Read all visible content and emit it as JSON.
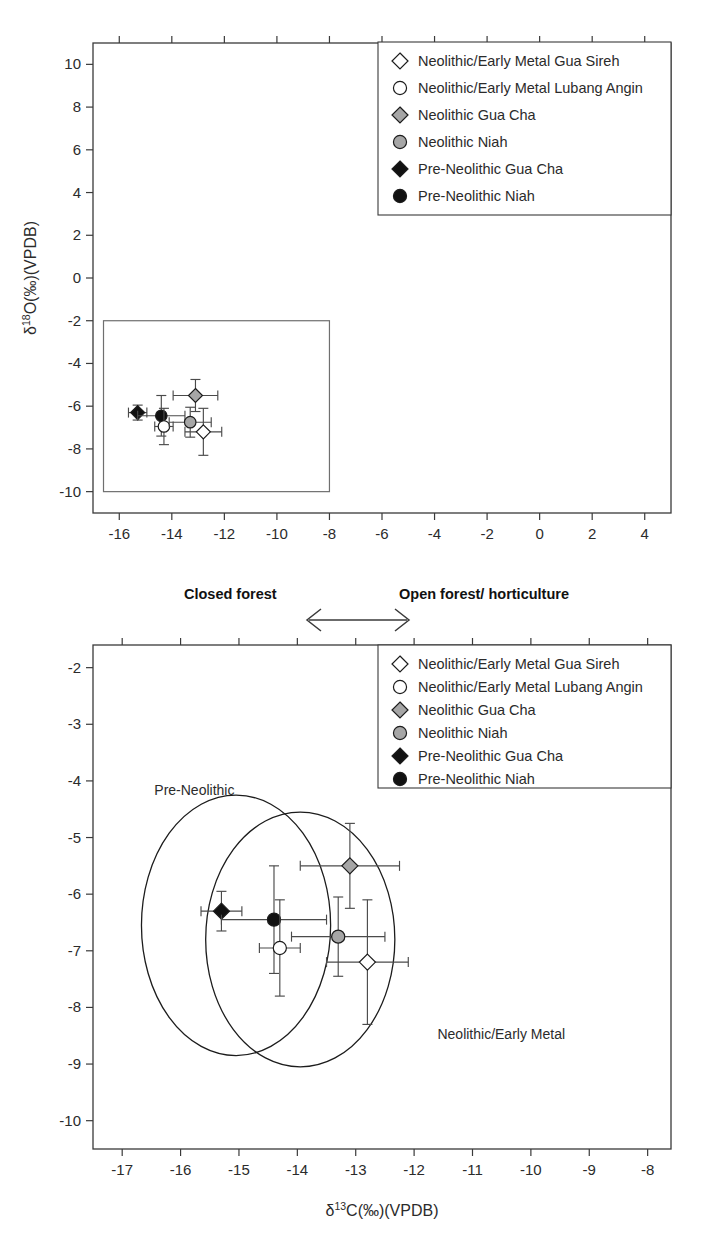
{
  "figure": {
    "background": "#ffffff",
    "ink": "#231f20"
  },
  "legend": {
    "entries": [
      {
        "label": "Neolithic/Early Metal Gua Sireh",
        "marker": "diamond",
        "fill": "#ffffff",
        "key": "nem_gua_sireh"
      },
      {
        "label": "Neolithic/Early Metal Lubang Angin",
        "marker": "circle",
        "fill": "#ffffff",
        "key": "nem_lubang_angin"
      },
      {
        "label": "Neolithic Gua Cha",
        "marker": "diamond",
        "fill": "#a6a6a6",
        "key": "neo_gua_cha"
      },
      {
        "label": "Neolithic Niah",
        "marker": "circle",
        "fill": "#a6a6a6",
        "key": "neo_niah"
      },
      {
        "label": "Pre-Neolithic Gua Cha",
        "marker": "diamond",
        "fill": "#111111",
        "key": "pre_gua_cha"
      },
      {
        "label": "Pre-Neolithic Niah",
        "marker": "circle",
        "fill": "#111111",
        "key": "pre_niah"
      }
    ]
  },
  "middle_annotation": {
    "left_label": "Closed forest",
    "right_label": "Open forest/ horticulture",
    "arrow": "double-headed-horizontal-arrow"
  },
  "axis_titles": {
    "d18O": {
      "delta": "δ",
      "sup": "18",
      "rest": "O(‰)(VPDB)"
    },
    "d13C": {
      "delta": "δ",
      "sup": "13",
      "rest": "C(‰)(VPDB)"
    }
  },
  "chart_data": [
    {
      "id": "top-panel",
      "type": "scatter",
      "title": "",
      "xlabel": "δ13C(‰)(VPDB)",
      "ylabel": "δ18O(‰)(VPDB)",
      "xlim": [
        -17,
        5
      ],
      "ylim": [
        -11,
        11
      ],
      "xticks": [
        -16,
        -14,
        -12,
        -10,
        -8,
        -6,
        -4,
        -2,
        0,
        2,
        4
      ],
      "yticks": [
        -10,
        -8,
        -6,
        -4,
        -2,
        0,
        2,
        4,
        6,
        8,
        10
      ],
      "xticklabels": [
        "-16",
        "-14",
        "-12",
        "-10",
        "-8",
        "-6",
        "-4",
        "-2",
        "0",
        "2",
        "4"
      ],
      "yticklabels": [
        "-10",
        "-8",
        "-6",
        "-4",
        "-2",
        "0",
        "2",
        "4",
        "6",
        "8",
        "10"
      ],
      "grid": false,
      "legend_position": "upper-right",
      "inset_rect": {
        "x0": -16.6,
        "y0": -10.0,
        "x1": -8.0,
        "y1": -2.0
      },
      "points": [
        {
          "key": "pre_gua_cha",
          "label": "Pre-Neolithic Gua Cha",
          "x": -15.3,
          "y": -6.3,
          "xerr": 0.35,
          "yerr": 0.35,
          "marker": "diamond",
          "fill": "#111111"
        },
        {
          "key": "pre_niah",
          "label": "Pre-Neolithic Niah",
          "x": -14.4,
          "y": -6.45,
          "xerr": 0.9,
          "yerr": 0.95,
          "marker": "circle",
          "fill": "#111111"
        },
        {
          "key": "nem_lubang_angin",
          "label": "Neolithic/Early Metal Lubang Angin",
          "x": -14.3,
          "y": -6.95,
          "xerr": 0.35,
          "yerr": 0.85,
          "marker": "circle",
          "fill": "#ffffff"
        },
        {
          "key": "neo_niah",
          "label": "Neolithic Niah",
          "x": -13.3,
          "y": -6.75,
          "xerr": 0.8,
          "yerr": 0.7,
          "marker": "circle",
          "fill": "#a6a6a6"
        },
        {
          "key": "neo_gua_cha",
          "label": "Neolithic Gua Cha",
          "x": -13.1,
          "y": -5.5,
          "xerr": 0.85,
          "yerr": 0.75,
          "marker": "diamond",
          "fill": "#a6a6a6"
        },
        {
          "key": "nem_gua_sireh",
          "label": "Neolithic/Early Metal Gua Sireh",
          "x": -12.8,
          "y": -7.2,
          "xerr": 0.7,
          "yerr": 1.1,
          "marker": "diamond",
          "fill": "#ffffff"
        }
      ]
    },
    {
      "id": "bottom-panel",
      "type": "scatter",
      "title": "",
      "xlabel": "δ13C(‰)(VPDB)",
      "ylabel": "δ18O(‰)(VPDB)",
      "xlim": [
        -17.5,
        -7.6
      ],
      "ylim": [
        -10.5,
        -1.6
      ],
      "xticks": [
        -17,
        -16,
        -15,
        -14,
        -13,
        -12,
        -11,
        -10,
        -9,
        -8
      ],
      "yticks": [
        -10,
        -9,
        -8,
        -7,
        -6,
        -5,
        -4,
        -3,
        -2
      ],
      "xticklabels": [
        "-17",
        "-16",
        "-15",
        "-14",
        "-13",
        "-12",
        "-11",
        "-10",
        "-9",
        "-8"
      ],
      "yticklabels": [
        "-10",
        "-9",
        "-8",
        "-7",
        "-6",
        "-5",
        "-4",
        "-3",
        "-2"
      ],
      "grid": false,
      "legend_position": "upper-right",
      "annotations": [
        {
          "text": "Pre-Neolithic",
          "x": -16.45,
          "y": -4.25
        },
        {
          "text": "Neolithic/Early Metal",
          "x": -11.6,
          "y": -8.55
        }
      ],
      "group_ellipses": [
        {
          "name": "Pre-Neolithic",
          "cx": -15.05,
          "cy": -6.55,
          "rx": 1.62,
          "ry": 2.3
        },
        {
          "name": "Neolithic/Early Metal",
          "cx": -13.95,
          "cy": -6.8,
          "rx": 1.62,
          "ry": 2.25
        }
      ],
      "points": [
        {
          "key": "pre_gua_cha",
          "label": "Pre-Neolithic Gua Cha",
          "x": -15.3,
          "y": -6.3,
          "xerr": 0.35,
          "yerr": 0.35,
          "marker": "diamond",
          "fill": "#111111"
        },
        {
          "key": "pre_niah",
          "label": "Pre-Neolithic Niah",
          "x": -14.4,
          "y": -6.45,
          "xerr": 0.9,
          "yerr": 0.95,
          "marker": "circle",
          "fill": "#111111"
        },
        {
          "key": "nem_lubang_angin",
          "label": "Neolithic/Early Metal Lubang Angin",
          "x": -14.3,
          "y": -6.95,
          "xerr": 0.35,
          "yerr": 0.85,
          "marker": "circle",
          "fill": "#ffffff"
        },
        {
          "key": "neo_niah",
          "label": "Neolithic Niah",
          "x": -13.3,
          "y": -6.75,
          "xerr": 0.8,
          "yerr": 0.7,
          "marker": "circle",
          "fill": "#a6a6a6"
        },
        {
          "key": "neo_gua_cha",
          "label": "Neolithic Gua Cha",
          "x": -13.1,
          "y": -5.5,
          "xerr": 0.85,
          "yerr": 0.75,
          "marker": "diamond",
          "fill": "#a6a6a6"
        },
        {
          "key": "nem_gua_sireh",
          "label": "Neolithic/Early Metal Gua Sireh",
          "x": -12.8,
          "y": -7.2,
          "xerr": 0.7,
          "yerr": 1.1,
          "marker": "diamond",
          "fill": "#ffffff"
        }
      ]
    }
  ]
}
